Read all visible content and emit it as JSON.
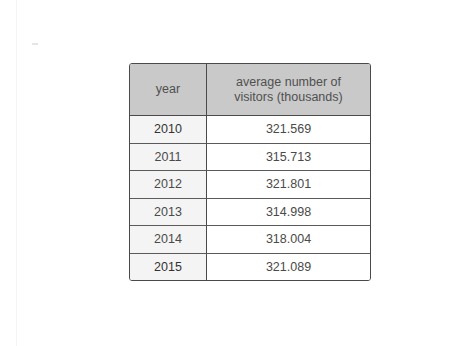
{
  "table": {
    "headers": {
      "year": "year",
      "visitors_line1": "average number of",
      "visitors_line2": "visitors (thousands)"
    },
    "rows": [
      {
        "year": "2010",
        "visitors": "321.569"
      },
      {
        "year": "2011",
        "visitors": "315.713"
      },
      {
        "year": "2012",
        "visitors": "321.801"
      },
      {
        "year": "2013",
        "visitors": "314.998"
      },
      {
        "year": "2014",
        "visitors": "318.004"
      },
      {
        "year": "2015",
        "visitors": "321.089"
      }
    ]
  },
  "colors": {
    "header_background": "#c9c9c9",
    "year_cell_background": "#f4f4f4",
    "border": "#4a4a4a",
    "text": "#4a4a4a"
  }
}
